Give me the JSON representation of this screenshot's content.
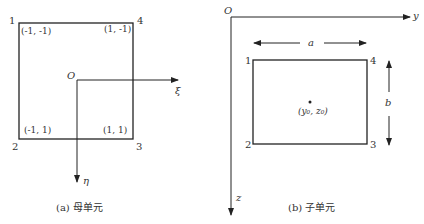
{
  "figure_a": {
    "caption": "(a) 母单元",
    "origin": "O",
    "xi_axis": "ξ",
    "eta_axis": "η",
    "nodes": [
      {
        "id": "1",
        "coord": "(-1, -1)"
      },
      {
        "id": "2",
        "coord": "(-1, 1)"
      },
      {
        "id": "3",
        "coord": "(1, 1)"
      },
      {
        "id": "4",
        "coord": "(1, -1)"
      }
    ]
  },
  "figure_b": {
    "caption": "(b) 子单元",
    "origin": "O",
    "y_axis": "y",
    "z_axis": "z",
    "width_label": "a",
    "height_label": "b",
    "center_label": "(y₀, z₀)",
    "nodes": [
      {
        "id": "1"
      },
      {
        "id": "2"
      },
      {
        "id": "3"
      },
      {
        "id": "4"
      }
    ]
  },
  "colors": {
    "line": "#222222",
    "text": "#333333"
  }
}
